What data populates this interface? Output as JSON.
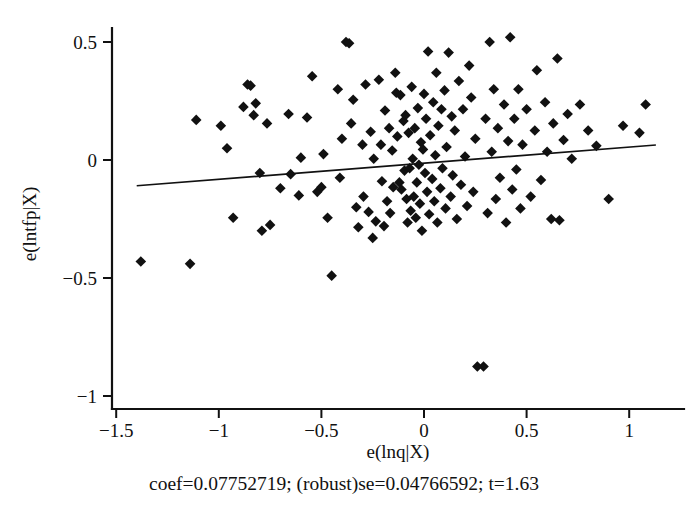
{
  "chart_data": {
    "type": "scatter",
    "title": "",
    "subtitle": "",
    "xlabel": "e(lnq|X)",
    "ylabel": "e(lntfp|X)",
    "caption": "coef=0.07752719; (robust)se=0.04766592; t=1.63",
    "xlim": [
      -1.5,
      1.15
    ],
    "ylim": [
      -1.0,
      0.58
    ],
    "xticks": [
      -1.5,
      -1,
      -0.5,
      0,
      0.5,
      1
    ],
    "xticklabels": [
      "-1.5",
      "-1",
      "-0.5",
      "0",
      "0.5",
      "1"
    ],
    "yticks": [
      0.5,
      0,
      -0.5,
      -1
    ],
    "yticklabels": [
      "0.5",
      "0",
      "-0.5",
      "-1"
    ],
    "grid": false,
    "legend": null,
    "marker": "diamond",
    "marker_color": "#111111",
    "fit_line": {
      "label": "linear fit",
      "slope": 0.07752719,
      "intercept": 0.0,
      "x_start": -1.4,
      "x_end": 1.13,
      "y_start": -0.109,
      "y_end": 0.0635,
      "color": "#111111"
    },
    "n_points": 153,
    "points": [
      [
        -1.38,
        -0.43
      ],
      [
        -1.14,
        -0.44
      ],
      [
        -1.11,
        0.17
      ],
      [
        -0.99,
        0.145
      ],
      [
        -0.96,
        0.05
      ],
      [
        -0.93,
        -0.245
      ],
      [
        -0.88,
        0.225
      ],
      [
        -0.86,
        0.32
      ],
      [
        -0.845,
        0.315
      ],
      [
        -0.83,
        0.19
      ],
      [
        -0.82,
        0.24
      ],
      [
        -0.8,
        -0.055
      ],
      [
        -0.79,
        -0.3
      ],
      [
        -0.765,
        0.155
      ],
      [
        -0.75,
        -0.275
      ],
      [
        -0.7,
        -0.12
      ],
      [
        -0.66,
        0.195
      ],
      [
        -0.65,
        -0.06
      ],
      [
        -0.61,
        -0.15
      ],
      [
        -0.6,
        0.01
      ],
      [
        -0.57,
        0.18
      ],
      [
        -0.545,
        0.355
      ],
      [
        -0.52,
        -0.135
      ],
      [
        -0.5,
        -0.115
      ],
      [
        -0.49,
        0.025
      ],
      [
        -0.47,
        -0.245
      ],
      [
        -0.45,
        -0.49
      ],
      [
        -0.42,
        0.3
      ],
      [
        -0.41,
        -0.075
      ],
      [
        -0.4,
        0.09
      ],
      [
        -0.38,
        0.5
      ],
      [
        -0.365,
        0.495
      ],
      [
        -0.355,
        0.155
      ],
      [
        -0.345,
        0.255
      ],
      [
        -0.33,
        -0.2
      ],
      [
        -0.32,
        -0.285
      ],
      [
        -0.3,
        0.065
      ],
      [
        -0.295,
        -0.155
      ],
      [
        -0.285,
        0.32
      ],
      [
        -0.27,
        -0.22
      ],
      [
        -0.26,
        0.12
      ],
      [
        -0.25,
        -0.33
      ],
      [
        -0.245,
        0.005
      ],
      [
        -0.235,
        -0.26
      ],
      [
        -0.22,
        0.34
      ],
      [
        -0.21,
        0.065
      ],
      [
        -0.205,
        -0.09
      ],
      [
        -0.195,
        -0.28
      ],
      [
        -0.19,
        0.21
      ],
      [
        -0.18,
        -0.175
      ],
      [
        -0.17,
        0.135
      ],
      [
        -0.165,
        -0.225
      ],
      [
        -0.155,
        0.04
      ],
      [
        -0.15,
        -0.115
      ],
      [
        -0.14,
        0.37
      ],
      [
        -0.135,
        0.285
      ],
      [
        -0.13,
        0.1
      ],
      [
        -0.12,
        -0.095
      ],
      [
        -0.115,
        0.275
      ],
      [
        -0.11,
        -0.125
      ],
      [
        -0.1,
        0.165
      ],
      [
        -0.095,
        -0.045
      ],
      [
        -0.09,
        0.19
      ],
      [
        -0.085,
        -0.165
      ],
      [
        -0.08,
        -0.265
      ],
      [
        -0.075,
        0.115
      ],
      [
        -0.07,
        -0.035
      ],
      [
        -0.065,
        -0.215
      ],
      [
        -0.06,
        0.31
      ],
      [
        -0.055,
        0.005
      ],
      [
        -0.05,
        -0.155
      ],
      [
        -0.045,
        0.135
      ],
      [
        -0.04,
        -0.245
      ],
      [
        -0.035,
        -0.095
      ],
      [
        -0.03,
        0.22
      ],
      [
        -0.025,
        -0.02
      ],
      [
        -0.02,
        -0.185
      ],
      [
        -0.015,
        0.075
      ],
      [
        -0.01,
        -0.3
      ],
      [
        -0.005,
        0.045
      ],
      [
        0.0,
        0.28
      ],
      [
        0.005,
        -0.055
      ],
      [
        0.01,
        0.175
      ],
      [
        0.015,
        -0.135
      ],
      [
        0.02,
        0.46
      ],
      [
        0.025,
        -0.23
      ],
      [
        0.03,
        0.105
      ],
      [
        0.04,
        -0.08
      ],
      [
        0.045,
        0.245
      ],
      [
        0.05,
        -0.175
      ],
      [
        0.055,
        0.02
      ],
      [
        0.06,
        0.37
      ],
      [
        0.065,
        -0.265
      ],
      [
        0.07,
        0.145
      ],
      [
        0.08,
        -0.12
      ],
      [
        0.085,
        0.215
      ],
      [
        0.09,
        -0.035
      ],
      [
        0.1,
        0.295
      ],
      [
        0.105,
        -0.205
      ],
      [
        0.11,
        0.055
      ],
      [
        0.12,
        0.455
      ],
      [
        0.13,
        -0.155
      ],
      [
        0.135,
        0.185
      ],
      [
        0.14,
        -0.065
      ],
      [
        0.15,
        0.125
      ],
      [
        0.16,
        -0.25
      ],
      [
        0.17,
        0.335
      ],
      [
        0.18,
        -0.105
      ],
      [
        0.19,
        0.215
      ],
      [
        0.2,
        0.015
      ],
      [
        0.21,
        -0.195
      ],
      [
        0.22,
        0.4
      ],
      [
        0.23,
        0.265
      ],
      [
        0.24,
        -0.135
      ],
      [
        0.25,
        0.09
      ],
      [
        0.26,
        -0.875
      ],
      [
        0.29,
        -0.875
      ],
      [
        0.3,
        0.175
      ],
      [
        0.31,
        -0.225
      ],
      [
        0.32,
        0.5
      ],
      [
        0.33,
        0.035
      ],
      [
        0.34,
        0.3
      ],
      [
        0.35,
        -0.165
      ],
      [
        0.36,
        0.135
      ],
      [
        0.37,
        -0.075
      ],
      [
        0.39,
        0.235
      ],
      [
        0.4,
        -0.265
      ],
      [
        0.41,
        0.08
      ],
      [
        0.42,
        0.52
      ],
      [
        0.43,
        -0.125
      ],
      [
        0.44,
        0.175
      ],
      [
        0.45,
        -0.04
      ],
      [
        0.46,
        0.3
      ],
      [
        0.47,
        -0.205
      ],
      [
        0.48,
        0.065
      ],
      [
        0.5,
        0.215
      ],
      [
        0.52,
        -0.155
      ],
      [
        0.54,
        0.125
      ],
      [
        0.55,
        0.38
      ],
      [
        0.57,
        -0.085
      ],
      [
        0.59,
        0.245
      ],
      [
        0.6,
        0.035
      ],
      [
        0.62,
        -0.25
      ],
      [
        0.63,
        0.155
      ],
      [
        0.65,
        0.43
      ],
      [
        0.66,
        -0.255
      ],
      [
        0.68,
        0.085
      ],
      [
        0.7,
        0.195
      ],
      [
        0.72,
        0.005
      ],
      [
        0.76,
        0.235
      ],
      [
        0.8,
        0.125
      ],
      [
        0.84,
        0.06
      ],
      [
        0.9,
        -0.165
      ],
      [
        0.97,
        0.145
      ],
      [
        1.05,
        0.115
      ],
      [
        1.08,
        0.235
      ]
    ]
  }
}
